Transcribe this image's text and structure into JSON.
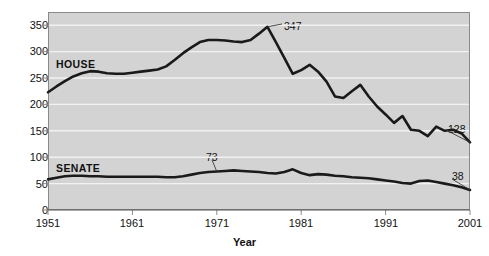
{
  "chart_data": {
    "type": "line",
    "title": "",
    "xlabel": "Year",
    "ylabel": "",
    "xlim": [
      1951,
      2001
    ],
    "ylim": [
      0,
      375
    ],
    "grid": true,
    "legend_position": "inline-labels",
    "y_ticks": [
      0,
      50,
      100,
      150,
      200,
      250,
      300,
      350
    ],
    "x_ticks": [
      1951,
      1961,
      1971,
      1981,
      1991,
      2001
    ],
    "x": [
      1951,
      1952,
      1953,
      1954,
      1955,
      1956,
      1957,
      1958,
      1959,
      1960,
      1961,
      1962,
      1963,
      1964,
      1965,
      1966,
      1967,
      1968,
      1969,
      1970,
      1971,
      1972,
      1973,
      1974,
      1975,
      1976,
      1977,
      1978,
      1979,
      1980,
      1981,
      1982,
      1983,
      1984,
      1985,
      1986,
      1987,
      1988,
      1989,
      1990,
      1991,
      1992,
      1993,
      1994,
      1995,
      1996,
      1997,
      1998,
      1999,
      2000,
      2001
    ],
    "series": [
      {
        "name": "HOUSE",
        "color": "#1a1a1a",
        "values": [
          223,
          234,
          244,
          253,
          259,
          263,
          262,
          259,
          258,
          258,
          260,
          262,
          264,
          266,
          272,
          284,
          297,
          308,
          318,
          322,
          322,
          321,
          319,
          318,
          322,
          334,
          347,
          318,
          288,
          258,
          265,
          275,
          262,
          243,
          215,
          212,
          225,
          237,
          215,
          196,
          181,
          165,
          178,
          152,
          150,
          140,
          158,
          150,
          152,
          145,
          128
        ]
      },
      {
        "name": "SENATE",
        "color": "#1a1a1a",
        "values": [
          58,
          61,
          64,
          65,
          65,
          64,
          64,
          63,
          63,
          63,
          63,
          63,
          63,
          63,
          62,
          62,
          64,
          67,
          70,
          72,
          73,
          74,
          75,
          74,
          73,
          72,
          70,
          69,
          72,
          77,
          70,
          66,
          68,
          67,
          65,
          64,
          62,
          61,
          60,
          58,
          56,
          54,
          51,
          50,
          55,
          56,
          53,
          50,
          47,
          43,
          38
        ]
      }
    ],
    "annotations": [
      {
        "label": "347",
        "series": "HOUSE",
        "x": 1977,
        "y": 347
      },
      {
        "label": "128",
        "series": "HOUSE",
        "x": 2001,
        "y": 128
      },
      {
        "label": "73",
        "series": "SENATE",
        "x": 1971,
        "y": 73
      },
      {
        "label": "38",
        "series": "SENATE",
        "x": 2001,
        "y": 38
      }
    ],
    "series_inline_labels": [
      {
        "label": "HOUSE",
        "x": 1956,
        "y": 288
      },
      {
        "label": "SENATE",
        "x": 1956,
        "y": 95
      }
    ],
    "style": {
      "plot_background": "#d3d3d3",
      "gridline_color": "#f2f2f2",
      "axis_color": "#8a8a8a",
      "line_color": "#1a1a1a",
      "text_color": "#111111"
    }
  }
}
